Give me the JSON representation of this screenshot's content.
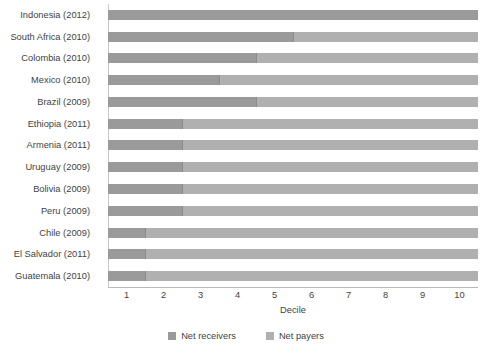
{
  "chart_data": {
    "type": "bar",
    "orientation": "horizontal",
    "stacked": true,
    "title": "",
    "xlabel": "Decile",
    "ylabel": "",
    "xlim": [
      0.5,
      10.5
    ],
    "grid": false,
    "legend_position": "bottom",
    "categories": [
      "Indonesia (2012)",
      "South Africa (2010)",
      "Colombia (2010)",
      "Mexico (2010)",
      "Brazil (2009)",
      "Ethiopia (2011)",
      "Armenia (2011)",
      "Uruguay (2009)",
      "Bolivia (2009)",
      "Peru (2009)",
      "Chile (2009)",
      "El Salvador (2011)",
      "Guatemala (2010)"
    ],
    "tick_labels": [
      "1",
      "2",
      "3",
      "4",
      "5",
      "6",
      "7",
      "8",
      "9",
      "10"
    ],
    "tick_values": [
      1,
      2,
      3,
      4,
      5,
      6,
      7,
      8,
      9,
      10
    ],
    "series": [
      {
        "name": "Net receivers",
        "color": "#9a9a9a",
        "values": [
          10,
          5,
          4,
          3,
          4,
          2,
          2,
          2,
          2,
          2,
          1,
          1,
          1
        ]
      },
      {
        "name": "Net payers",
        "color": "#b0b0b0",
        "values": [
          0,
          5,
          6,
          7,
          6,
          8,
          8,
          8,
          8,
          8,
          9,
          9,
          9
        ]
      }
    ],
    "crossover_decile": [
      10,
      5,
      4,
      3,
      4,
      2,
      2,
      2,
      2,
      2,
      1,
      1,
      1
    ]
  },
  "legend": {
    "items": [
      {
        "label": "Net receivers",
        "color": "#9a9a9a"
      },
      {
        "label": "Net payers",
        "color": "#b0b0b0"
      }
    ]
  },
  "axis": {
    "x_title": "Decile"
  }
}
